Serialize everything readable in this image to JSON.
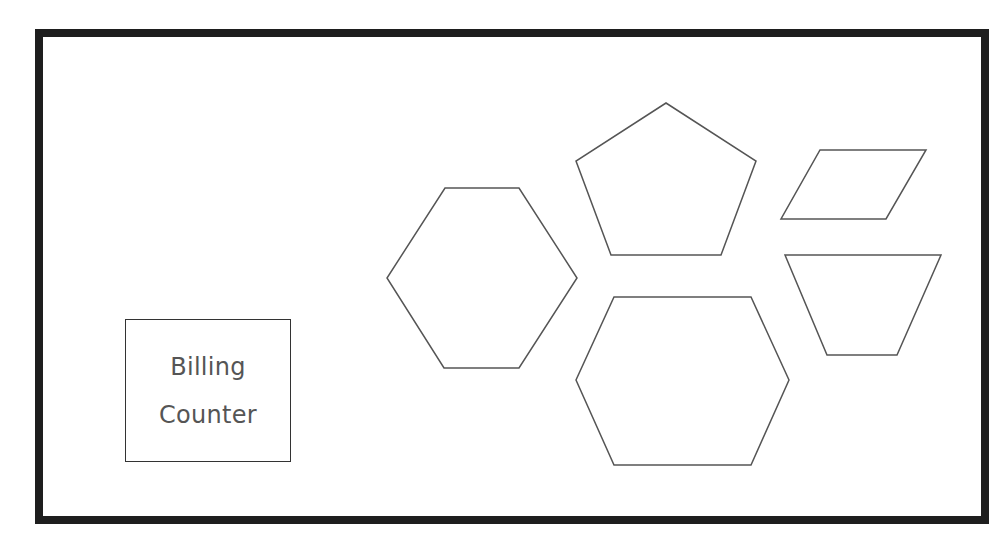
{
  "diagram": {
    "type": "floor-layout",
    "frame": {
      "border_color": "#1e1e1e",
      "background": "#ffffff"
    },
    "billing_counter": {
      "label_lines": [
        "Billing",
        "Counter"
      ],
      "text_color": "#555555",
      "border_color": "#333333"
    },
    "shapes": [
      {
        "id": "hexagon-left",
        "kind": "hexagon",
        "points": "445,188 519,188 577,278 519,368 444,368 387,278"
      },
      {
        "id": "pentagon",
        "kind": "pentagon",
        "points": "666,103 756,161 721,255 611,255 576,161"
      },
      {
        "id": "parallelogram",
        "kind": "parallelogram",
        "points": "820,150 926,150 886,219 781,219"
      },
      {
        "id": "trapezoid",
        "kind": "trapezoid",
        "points": "785,255 941,255 897,355 827,355"
      },
      {
        "id": "hexagon-bottom",
        "kind": "hexagon",
        "points": "614,297 751,297 789,380 751,465 614,465 576,380"
      }
    ],
    "shape_stroke_color": "#555555"
  }
}
